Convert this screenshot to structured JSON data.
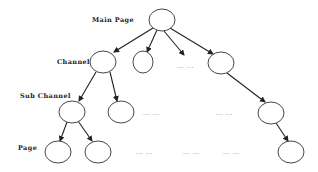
{
  "diagram": {
    "type": "tree",
    "levels": {
      "main_page": "Main Page",
      "channel": "Channel",
      "sub_channel": "Sub Channel",
      "page": "Page"
    },
    "ellipsis": "... ...",
    "nodes": [
      {
        "id": "root",
        "level": "main_page",
        "x": 162,
        "y": 20
      },
      {
        "id": "c1",
        "level": "channel",
        "x": 103,
        "y": 62
      },
      {
        "id": "c2",
        "level": "channel",
        "x": 143,
        "y": 62
      },
      {
        "id": "c3",
        "level": "channel",
        "x": 221,
        "y": 63
      },
      {
        "id": "s1",
        "level": "sub_channel",
        "x": 72,
        "y": 112
      },
      {
        "id": "s2",
        "level": "sub_channel",
        "x": 121,
        "y": 112
      },
      {
        "id": "s3",
        "level": "sub_channel",
        "x": 271,
        "y": 113
      },
      {
        "id": "p1",
        "level": "page",
        "x": 58,
        "y": 152
      },
      {
        "id": "p2",
        "level": "page",
        "x": 98,
        "y": 152
      },
      {
        "id": "p3",
        "level": "page",
        "x": 291,
        "y": 152
      }
    ],
    "edges": [
      [
        "root",
        "c1"
      ],
      [
        "root",
        "c2"
      ],
      [
        "root",
        "ellipsis-c"
      ],
      [
        "root",
        "c3"
      ],
      [
        "c1",
        "s1"
      ],
      [
        "c1",
        "s2"
      ],
      [
        "c3",
        "s3"
      ],
      [
        "s1",
        "p1"
      ],
      [
        "s1",
        "p2"
      ],
      [
        "s3",
        "p3"
      ]
    ]
  }
}
